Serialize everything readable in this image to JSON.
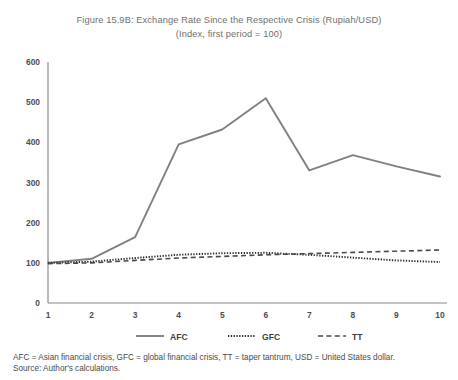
{
  "figure": {
    "title_line1": "Figure 15.9B: Exchange Rate Since the Respective Crisis (Rupiah/USD)",
    "title_line2": "(Index, first period = 100)",
    "footnote_line1": "AFC = Asian financial crisis, GFC = global financial crisis, TT = taper tantrum, USD = United States dollar.",
    "footnote_line2": "Source: Author's calculations."
  },
  "chart_data": {
    "type": "line",
    "title": "Figure 15.9B: Exchange Rate Since the Respective Crisis (Rupiah/USD) (Index, first period = 100)",
    "xlabel": "",
    "ylabel": "",
    "x": [
      1,
      2,
      3,
      4,
      5,
      6,
      7,
      8,
      9,
      10
    ],
    "xtick_labels": [
      "1",
      "2",
      "3",
      "4",
      "5",
      "6",
      "7",
      "8",
      "9",
      "10"
    ],
    "ytick_labels": [
      "0",
      "100",
      "200",
      "300",
      "400",
      "500",
      "600"
    ],
    "yticks": [
      0,
      100,
      200,
      300,
      400,
      500,
      600
    ],
    "xlim": [
      1,
      10
    ],
    "ylim": [
      0,
      600
    ],
    "grid": false,
    "legend_position": "bottom",
    "series": [
      {
        "name": "AFC",
        "style": "solid",
        "color": "#808080",
        "values": [
          100,
          110,
          164,
          395,
          432,
          510,
          330,
          368,
          340,
          315
        ]
      },
      {
        "name": "GFC",
        "style": "dotted",
        "color": "#2b2b2b",
        "values": [
          100,
          103,
          112,
          120,
          124,
          125,
          120,
          113,
          106,
          102
        ]
      },
      {
        "name": "TT",
        "style": "dashed",
        "color": "#4a4a4a",
        "values": [
          98,
          100,
          106,
          112,
          116,
          120,
          123,
          126,
          129,
          132
        ]
      }
    ]
  },
  "legend": {
    "items": [
      {
        "label": "AFC",
        "style": "solid"
      },
      {
        "label": "GFC",
        "style": "dotted"
      },
      {
        "label": "TT",
        "style": "dashed"
      }
    ]
  },
  "colors": {
    "afc": "#808080",
    "gfc": "#2b2b2b",
    "tt": "#4a4a4a",
    "axis": "#8a8a8a",
    "title": "#6f6f6f",
    "footnote": "#4a4a4a"
  }
}
